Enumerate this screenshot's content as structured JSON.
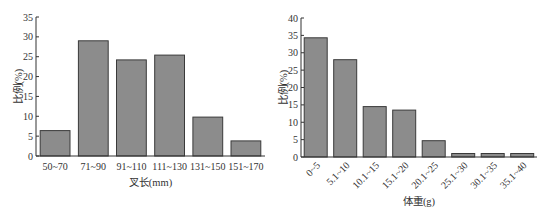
{
  "chart_data": [
    {
      "type": "bar",
      "title": "",
      "xlabel": "叉长(mm)",
      "ylabel": "比例(%)",
      "categories": [
        "50~70",
        "71~90",
        "91~110",
        "111~130",
        "131~150",
        "151~170"
      ],
      "values": [
        6.4,
        29.0,
        24.2,
        25.4,
        9.8,
        3.8
      ],
      "ylim": [
        0,
        35
      ],
      "yticks": [
        0,
        5,
        10,
        15,
        20,
        25,
        30,
        35
      ],
      "grid": false,
      "legend": null,
      "bar_color": "#8c8c8c"
    },
    {
      "type": "bar",
      "title": "",
      "xlabel": "体重(g)",
      "ylabel": "比例(%)",
      "categories": [
        "0~5",
        "5.1~10",
        "10.1~15",
        "15.1~20",
        "20.1~25",
        "25.1~30",
        "30.1~35",
        "35.1~40"
      ],
      "values": [
        34.3,
        28.0,
        14.5,
        13.5,
        4.7,
        1.0,
        1.0,
        1.0
      ],
      "ylim": [
        0,
        40
      ],
      "yticks": [
        0,
        5,
        10,
        15,
        20,
        25,
        30,
        35,
        40
      ],
      "grid": false,
      "legend": null,
      "bar_color": "#8c8c8c",
      "xtick_rotation": -45
    }
  ]
}
